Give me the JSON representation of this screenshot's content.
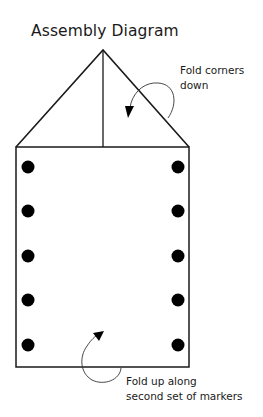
{
  "title": "Assembly Diagram",
  "annotations": {
    "fold_corners": [
      "Fold corners",
      "down"
    ],
    "fold_up": [
      "Fold up along",
      "second set of markers"
    ]
  },
  "diagram": {
    "shape": "rectangle with triangular top flap",
    "markers_per_side": 5,
    "marker_color": "#000000",
    "line_color": "#1a1a1a"
  }
}
